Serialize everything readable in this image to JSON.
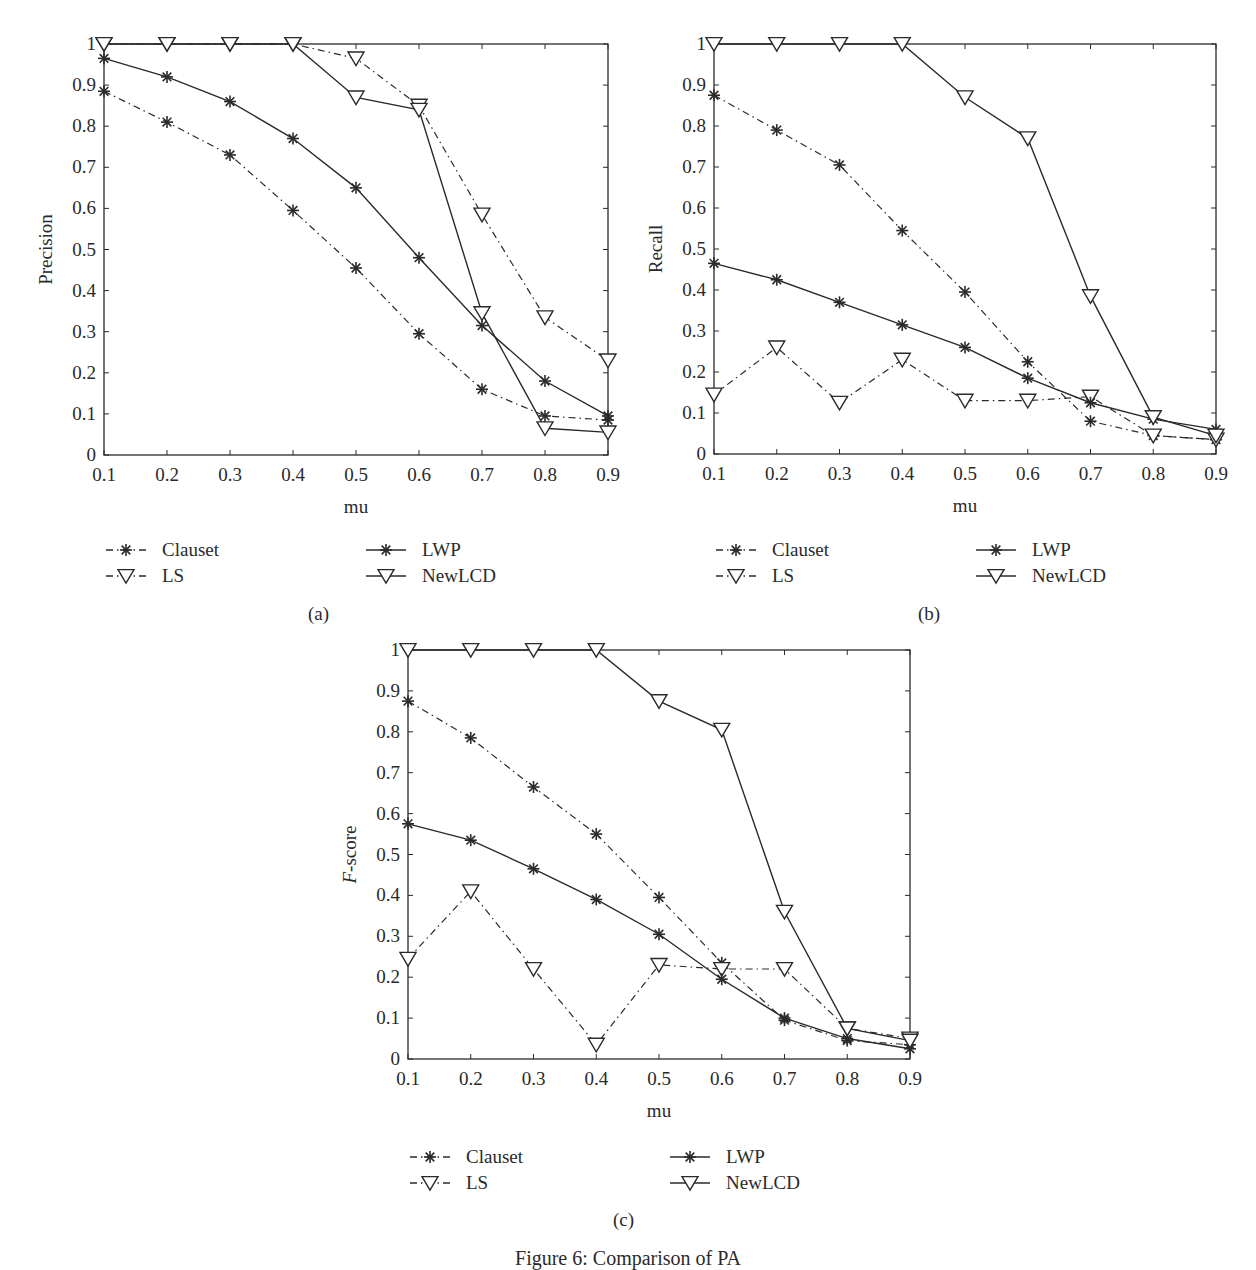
{
  "figure": {
    "caption": "Figure 6: Comparison of PA"
  },
  "legend": {
    "items": [
      {
        "name": "Clauset",
        "marker": "asterisk-icon",
        "line": "dashdot"
      },
      {
        "name": "LS",
        "marker": "triangle-down-icon",
        "line": "dashdot"
      },
      {
        "name": "LWP",
        "marker": "asterisk-icon",
        "line": "solid"
      },
      {
        "name": "NewLCD",
        "marker": "triangle-down-icon",
        "line": "solid"
      }
    ]
  },
  "colors": {
    "line": "#2a2a2a",
    "background": "#ffffff"
  },
  "panels": [
    {
      "id": "a",
      "label": "(a)"
    },
    {
      "id": "b",
      "label": "(b)"
    },
    {
      "id": "c",
      "label": "(c)"
    }
  ],
  "chart_data": [
    {
      "type": "line",
      "panel": "(a)",
      "title": "",
      "xlabel": "mu",
      "ylabel": "Precision",
      "x": [
        0.1,
        0.2,
        0.3,
        0.4,
        0.5,
        0.6,
        0.7,
        0.8,
        0.9
      ],
      "xticks": [
        "0.1",
        "0.2",
        "0.3",
        "0.4",
        "0.5",
        "0.6",
        "0.7",
        "0.8",
        "0.9"
      ],
      "yticks": [
        "0",
        "0.1",
        "0.2",
        "0.3",
        "0.4",
        "0.5",
        "0.6",
        "0.7",
        "0.8",
        "0.9",
        "1"
      ],
      "xlim": [
        0.1,
        0.9
      ],
      "ylim": [
        0,
        1
      ],
      "grid": false,
      "legend_position": "below",
      "series": [
        {
          "name": "Clauset",
          "style": "dashdot",
          "marker": "asterisk",
          "values": [
            0.885,
            0.81,
            0.73,
            0.595,
            0.455,
            0.295,
            0.16,
            0.095,
            0.085
          ]
        },
        {
          "name": "LS",
          "style": "dashdot",
          "marker": "triangle-down",
          "values": [
            1.0,
            1.0,
            1.0,
            1.0,
            0.965,
            0.85,
            0.585,
            0.335,
            0.23
          ]
        },
        {
          "name": "LWP",
          "style": "solid",
          "marker": "asterisk",
          "values": [
            0.965,
            0.92,
            0.86,
            0.77,
            0.65,
            0.48,
            0.315,
            0.18,
            0.095
          ]
        },
        {
          "name": "NewLCD",
          "style": "solid",
          "marker": "triangle-down",
          "values": [
            1.0,
            1.0,
            1.0,
            1.0,
            0.87,
            0.84,
            0.345,
            0.065,
            0.055
          ]
        }
      ]
    },
    {
      "type": "line",
      "panel": "(b)",
      "title": "",
      "xlabel": "mu",
      "ylabel": "Recall",
      "x": [
        0.1,
        0.2,
        0.3,
        0.4,
        0.5,
        0.6,
        0.7,
        0.8,
        0.9
      ],
      "xticks": [
        "0.1",
        "0.2",
        "0.3",
        "0.4",
        "0.5",
        "0.6",
        "0.7",
        "0.8",
        "0.9"
      ],
      "yticks": [
        "0",
        "0.1",
        "0.2",
        "0.3",
        "0.4",
        "0.5",
        "0.6",
        "0.7",
        "0.8",
        "0.9",
        "1"
      ],
      "xlim": [
        0.1,
        0.9
      ],
      "ylim": [
        0,
        1
      ],
      "grid": false,
      "legend_position": "below",
      "series": [
        {
          "name": "Clauset",
          "style": "dashdot",
          "marker": "asterisk",
          "values": [
            0.875,
            0.79,
            0.705,
            0.545,
            0.395,
            0.225,
            0.08,
            0.045,
            0.035
          ]
        },
        {
          "name": "LS",
          "style": "dashdot",
          "marker": "triangle-down",
          "values": [
            0.145,
            0.26,
            0.125,
            0.23,
            0.13,
            0.13,
            0.14,
            0.045,
            0.035
          ]
        },
        {
          "name": "LWP",
          "style": "solid",
          "marker": "asterisk",
          "values": [
            0.465,
            0.425,
            0.37,
            0.315,
            0.26,
            0.185,
            0.125,
            0.085,
            0.06
          ]
        },
        {
          "name": "NewLCD",
          "style": "solid",
          "marker": "triangle-down",
          "values": [
            1.0,
            1.0,
            1.0,
            1.0,
            0.87,
            0.77,
            0.385,
            0.09,
            0.045
          ]
        }
      ]
    },
    {
      "type": "line",
      "panel": "(c)",
      "title": "",
      "xlabel": "mu",
      "ylabel": "F-score",
      "x": [
        0.1,
        0.2,
        0.3,
        0.4,
        0.5,
        0.6,
        0.7,
        0.8,
        0.9
      ],
      "xticks": [
        "0.1",
        "0.2",
        "0.3",
        "0.4",
        "0.5",
        "0.6",
        "0.7",
        "0.8",
        "0.9"
      ],
      "yticks": [
        "0",
        "0.1",
        "0.2",
        "0.3",
        "0.4",
        "0.5",
        "0.6",
        "0.7",
        "0.8",
        "0.9",
        "1"
      ],
      "xlim": [
        0.1,
        0.9
      ],
      "ylim": [
        0,
        1
      ],
      "grid": false,
      "legend_position": "below",
      "series": [
        {
          "name": "Clauset",
          "style": "dashdot",
          "marker": "asterisk",
          "values": [
            0.875,
            0.785,
            0.665,
            0.55,
            0.395,
            0.235,
            0.095,
            0.045,
            0.035
          ]
        },
        {
          "name": "LS",
          "style": "dashdot",
          "marker": "triangle-down",
          "values": [
            0.245,
            0.41,
            0.22,
            0.035,
            0.23,
            0.22,
            0.22,
            0.075,
            0.05
          ]
        },
        {
          "name": "LWP",
          "style": "solid",
          "marker": "asterisk",
          "values": [
            0.575,
            0.535,
            0.465,
            0.39,
            0.305,
            0.195,
            0.1,
            0.05,
            0.025
          ]
        },
        {
          "name": "NewLCD",
          "style": "solid",
          "marker": "triangle-down",
          "values": [
            1.0,
            1.0,
            1.0,
            1.0,
            0.875,
            0.805,
            0.36,
            0.075,
            0.045
          ]
        }
      ]
    }
  ]
}
